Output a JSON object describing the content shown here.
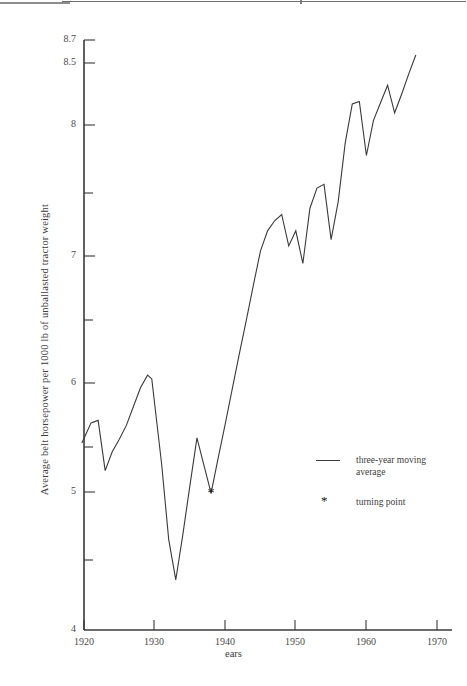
{
  "figure": {
    "y_axis_title": "Average belt horsepower per 1000 lb of unballasted tractor weight",
    "x_axis_title": "ears",
    "x_axis_title_full": "Years"
  },
  "legend": {
    "position": "inside-lower-right",
    "items": [
      {
        "key": "line",
        "label": "three-year moving\naverage"
      },
      {
        "key": "star",
        "label": "turning point",
        "glyph": "*"
      }
    ]
  },
  "chart_data": {
    "type": "line",
    "title": "",
    "xlabel": "Years",
    "ylabel": "Average belt horsepower per 1000 lb of unballasted tractor weight",
    "xlim": [
      1919,
      1970
    ],
    "ylim": [
      4,
      8.7
    ],
    "grid": false,
    "x_ticks": [
      1920,
      1930,
      1940,
      1950,
      1960,
      1970
    ],
    "x_tick_labels": [
      "1920",
      "1930",
      "1940",
      "1950",
      "1960",
      "1970"
    ],
    "y_ticks": [
      4,
      4.5,
      5,
      5.5,
      6,
      6.5,
      7,
      7.5,
      8,
      8.5,
      8.7
    ],
    "y_tick_labels": [
      "4",
      "",
      "5",
      "",
      "6",
      "",
      "7",
      "",
      "8",
      "8.5",
      "8.7"
    ],
    "line_color": "#3a3a3a",
    "series": [
      {
        "name": "three-year moving average",
        "x": [
          1919.7,
          1921,
          1922,
          1923,
          1924,
          1925,
          1926,
          1927,
          1928,
          1929,
          1929.6,
          1931,
          1932,
          1933,
          1934,
          1935,
          1936,
          1937,
          1938,
          1939,
          1940,
          1941,
          1942,
          1943,
          1944,
          1945,
          1946,
          1947,
          1948,
          1949,
          1950,
          1951,
          1952,
          1953,
          1954,
          1955,
          1956,
          1957,
          1958,
          1959,
          1960,
          1961,
          1962,
          1963,
          1964,
          1965,
          1966,
          1967
        ],
        "y": [
          5.49,
          5.65,
          5.67,
          5.27,
          5.42,
          5.52,
          5.63,
          5.78,
          5.93,
          6.03,
          6.0,
          5.32,
          4.72,
          4.4,
          4.76,
          5.15,
          5.53,
          5.31,
          5.09,
          5.37,
          5.64,
          5.92,
          6.2,
          6.47,
          6.75,
          7.02,
          7.18,
          7.26,
          7.31,
          7.06,
          7.18,
          6.92,
          7.36,
          7.52,
          7.55,
          7.11,
          7.41,
          7.88,
          8.19,
          8.21,
          7.78,
          8.06,
          8.2,
          8.34,
          8.12,
          8.27,
          8.43,
          8.58
        ]
      }
    ],
    "markers": [
      {
        "name": "turning point",
        "x": 1938,
        "y": 5.09,
        "glyph": "*"
      }
    ],
    "annotations": []
  },
  "axis_geometry": {
    "x_px": {
      "1920": 84,
      "1970": 437
    },
    "y_px": {
      "4": 630,
      "8.7": 40
    }
  }
}
